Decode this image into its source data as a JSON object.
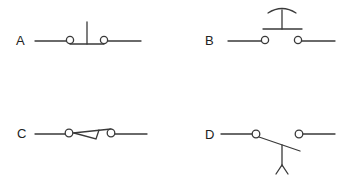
{
  "diagram": {
    "title": "",
    "colors": {
      "line": "#3a3a3a",
      "background": "#ffffff"
    },
    "switches": [
      {
        "id": "A",
        "label": "A",
        "type": "push-button-normally-closed"
      },
      {
        "id": "B",
        "label": "B",
        "type": "push-button-normally-open"
      },
      {
        "id": "C",
        "label": "C",
        "type": "toggle-switch"
      },
      {
        "id": "D",
        "label": "D",
        "type": "foot-operated-switch"
      }
    ]
  }
}
